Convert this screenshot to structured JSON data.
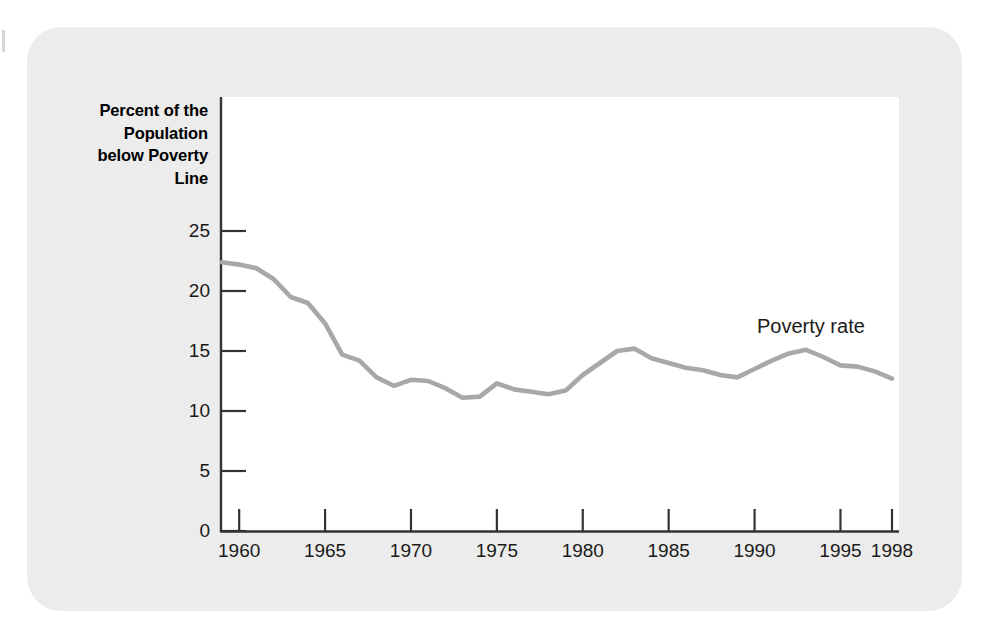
{
  "figure": {
    "panel_color": "#ececec",
    "plot_background": "#ffffff",
    "axis_color": "#333333",
    "line_color": "#a8a8a8",
    "y_axis_title": "Percent of the\nPopulation\nbelow Poverty\nLine",
    "series_annotation": "Poverty rate"
  },
  "chart_data": {
    "type": "line",
    "title": "",
    "subtitle": "",
    "xlabel": "",
    "ylabel": "Percent of the Population below Poverty Line",
    "xlim": [
      1959,
      1998
    ],
    "ylim": [
      0,
      27
    ],
    "grid": false,
    "legend_position": "inline-annotation",
    "x_tick_labels": [
      "1960",
      "1965",
      "1970",
      "1975",
      "1980",
      "1985",
      "1990",
      "1995",
      "1998"
    ],
    "x_ticks": [
      1960,
      1965,
      1970,
      1975,
      1980,
      1985,
      1990,
      1995,
      1998
    ],
    "y_tick_labels": [
      "0",
      "5",
      "10",
      "15",
      "20",
      "25"
    ],
    "y_ticks": [
      0,
      5,
      10,
      15,
      20,
      25
    ],
    "series": [
      {
        "name": "Poverty rate",
        "color": "#a8a8a8",
        "x": [
          1959,
          1960,
          1961,
          1962,
          1963,
          1964,
          1965,
          1966,
          1967,
          1968,
          1969,
          1970,
          1971,
          1972,
          1973,
          1974,
          1975,
          1976,
          1977,
          1978,
          1979,
          1980,
          1981,
          1982,
          1983,
          1984,
          1985,
          1986,
          1987,
          1988,
          1989,
          1990,
          1991,
          1992,
          1993,
          1994,
          1995,
          1996,
          1997,
          1998
        ],
        "values": [
          22.4,
          22.2,
          21.9,
          21.0,
          19.5,
          19.0,
          17.3,
          14.7,
          14.2,
          12.8,
          12.1,
          12.6,
          12.5,
          11.9,
          11.1,
          11.2,
          12.3,
          11.8,
          11.6,
          11.4,
          11.7,
          13.0,
          14.0,
          15.0,
          15.2,
          14.4,
          14.0,
          13.6,
          13.4,
          13.0,
          12.8,
          13.5,
          14.2,
          14.8,
          15.1,
          14.5,
          13.8,
          13.7,
          13.3,
          12.7
        ]
      }
    ]
  }
}
